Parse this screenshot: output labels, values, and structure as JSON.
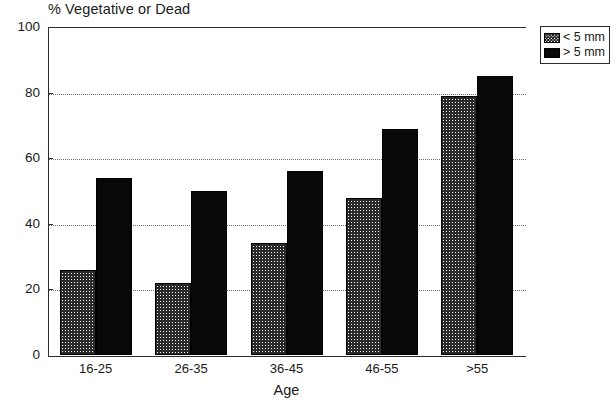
{
  "chart_data": {
    "type": "bar",
    "title": "% Vegetative or Dead",
    "xlabel": "Age",
    "ylabel": "",
    "categories": [
      "16-25",
      "26-35",
      "36-45",
      "46-55",
      ">55"
    ],
    "series": [
      {
        "name": "< 5 mm",
        "values": [
          26,
          22,
          34,
          48,
          79
        ],
        "pattern": "crosshatch",
        "color": "#ffffff"
      },
      {
        "name": "> 5 mm",
        "values": [
          54,
          50,
          56,
          69,
          85
        ],
        "pattern": "solid",
        "color": "#080808"
      }
    ],
    "ylim": [
      0,
      100
    ],
    "yticks": [
      0,
      20,
      40,
      60,
      80,
      100
    ],
    "ytick_labels": [
      "0",
      "20",
      "40",
      "60",
      "80",
      "100"
    ],
    "grid": true,
    "grid_axis": "y",
    "grid_style": "dotted",
    "legend_position": "outside-top-right",
    "legend_entries": [
      "< 5 mm",
      "> 5 mm"
    ]
  },
  "axis": {
    "y_labels": [
      "100",
      "80",
      "60",
      "40",
      "20",
      "0"
    ],
    "x_labels": [
      "16-25",
      "26-35",
      "36-45",
      "46-55",
      ">55"
    ],
    "x_title": "Age"
  },
  "legend": {
    "items": [
      {
        "label": "< 5 mm",
        "swatch": "crosshatch-swatch"
      },
      {
        "label": "> 5 mm",
        "swatch": "solid-black-swatch"
      }
    ]
  }
}
